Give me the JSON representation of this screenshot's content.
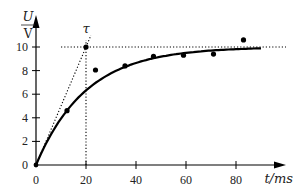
{
  "chart_data": {
    "type": "scatter",
    "title": "",
    "xlabel": "t/ms",
    "ylabel": "U/V",
    "xlim": [
      0,
      100
    ],
    "ylim": [
      0,
      12
    ],
    "x_ticks": [
      0,
      20,
      40,
      60,
      80
    ],
    "y_ticks": [
      0,
      2,
      4,
      6,
      8,
      10
    ],
    "grid": false,
    "annotations": [
      {
        "text": "τ",
        "x": 20,
        "y": 11.2
      },
      {
        "type": "dotted-hline",
        "y": 10,
        "x_range": [
          10,
          100
        ]
      },
      {
        "type": "dotted-vline",
        "x": 20,
        "y_range": [
          0,
          10.6
        ]
      },
      {
        "type": "dotted-tangent",
        "from": [
          0,
          0
        ],
        "to": [
          22,
          11
        ]
      }
    ],
    "series": [
      {
        "name": "measured",
        "kind": "points",
        "x": [
          12.4,
          20,
          23.8,
          35.6,
          47,
          59,
          71,
          83
        ],
        "y": [
          4.6,
          10.0,
          8.05,
          8.4,
          9.2,
          9.3,
          9.4,
          10.6
        ]
      },
      {
        "name": "fit U = 10(1 - e^(-t/20))",
        "kind": "line",
        "U0": 10,
        "tau": 20,
        "t_range": [
          0,
          90
        ]
      }
    ]
  },
  "labels": {
    "y_var": "U",
    "y_unit": "V",
    "x_label": "t/ms",
    "tau": "τ"
  }
}
